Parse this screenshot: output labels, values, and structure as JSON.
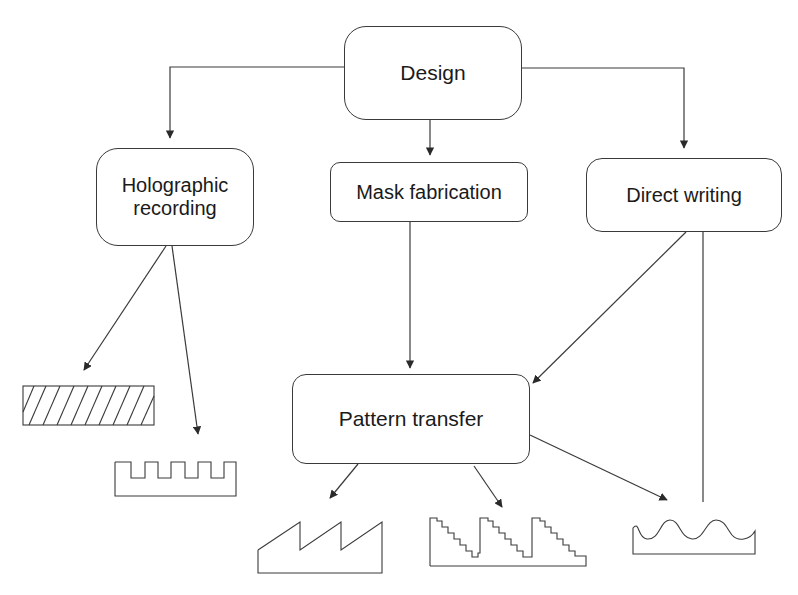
{
  "diagram": {
    "nodes": {
      "design": {
        "label": "Design"
      },
      "holographic": {
        "label_line1": "Holographic",
        "label_line2": "recording"
      },
      "mask": {
        "label": "Mask fabrication"
      },
      "direct": {
        "label": "Direct writing"
      },
      "pattern": {
        "label": "Pattern transfer"
      }
    },
    "profiles": [
      {
        "id": "slanted-hatched-grating",
        "from": "holographic"
      },
      {
        "id": "binary-grating",
        "from": "holographic"
      },
      {
        "id": "blazed-sawtooth-grating",
        "from": "pattern"
      },
      {
        "id": "multilevel-staircase-grating",
        "from": "pattern"
      },
      {
        "id": "continuous-sinusoidal-relief",
        "from": [
          "pattern",
          "direct"
        ]
      }
    ],
    "edges": [
      {
        "from": "design",
        "to": "holographic"
      },
      {
        "from": "design",
        "to": "mask"
      },
      {
        "from": "design",
        "to": "direct"
      },
      {
        "from": "mask",
        "to": "pattern"
      },
      {
        "from": "direct",
        "to": "pattern"
      },
      {
        "from": "direct",
        "to": "continuous-sinusoidal-relief"
      },
      {
        "from": "holographic",
        "to": "slanted-hatched-grating"
      },
      {
        "from": "holographic",
        "to": "binary-grating"
      },
      {
        "from": "pattern",
        "to": "blazed-sawtooth-grating"
      },
      {
        "from": "pattern",
        "to": "multilevel-staircase-grating"
      },
      {
        "from": "pattern",
        "to": "continuous-sinusoidal-relief"
      }
    ],
    "stroke_color": "#3a3a3a"
  }
}
